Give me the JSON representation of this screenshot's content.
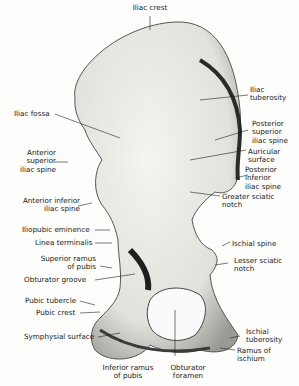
{
  "figure": {
    "labels": {
      "iliac_crest": "Iliac crest",
      "iliac_fossa": "Iliac fossa",
      "iliac_tuberosity": "Iliac\ntuberosity",
      "posterior_superior_iliac_spine": "Posterior\nsuperior\niliac spine",
      "auricular_surface": "Auricular\nsurface",
      "posterior_inferior_iliac_spine": "Posterior\ninferior\niliac spine",
      "greater_sciatic_notch": "Greater sciatic\nnotch",
      "anterior_superior_iliac_spine": "Anterior\nsuperior\niliac spine",
      "anterior_inferior_iliac_spine": "Anterior inferior\niliac spine",
      "iliopubic_eminence": "Iliopubic eminence",
      "linea_terminalis": "Linea terminalis",
      "superior_ramus_of_pubis": "Superior ramus\nof pubis",
      "obturator_groove": "Obturator groove",
      "pubic_tubercle": "Pubic tubercle",
      "pubic_crest": "Pubic crest",
      "symphysial_surface": "Symphysial surface",
      "inferior_ramus_of_pubis": "Inferior ramus\nof pubis",
      "obturator_foramen": "Obturator\nforamen",
      "ischial_spine": "Ischial spine",
      "lesser_sciatic_notch": "Lesser sciatic\nnotch",
      "ischial_tuberosity": "Ischial\ntuberosity",
      "ramus_of_ischium": "Ramus of\nischium"
    }
  }
}
